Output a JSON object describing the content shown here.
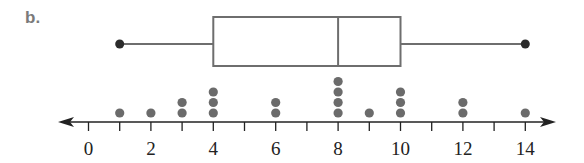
{
  "part_label": "b.",
  "chart_data": {
    "type": "box_and_dot_plot",
    "title": "",
    "xlabel": "",
    "ylabel": "",
    "xlim": [
      0,
      14
    ],
    "tick_labels": [
      "0",
      "2",
      "4",
      "6",
      "8",
      "10",
      "12",
      "14"
    ],
    "minor_ticks": [
      0,
      1,
      2,
      3,
      4,
      5,
      6,
      7,
      8,
      9,
      10,
      11,
      12,
      13,
      14
    ],
    "box_plot": {
      "min": 1,
      "q1": 4,
      "median": 8,
      "q3": 10,
      "max": 14
    },
    "dot_plot": {
      "x": [
        1,
        2,
        3,
        4,
        6,
        8,
        9,
        10,
        12,
        14
      ],
      "counts": [
        1,
        1,
        2,
        3,
        2,
        4,
        1,
        3,
        2,
        1
      ]
    },
    "colors": {
      "box_stroke": "#6e6e6e",
      "dot_fill": "#6b6b6b",
      "whisker_end": "#2b2b2b",
      "axis": "#222222"
    }
  }
}
